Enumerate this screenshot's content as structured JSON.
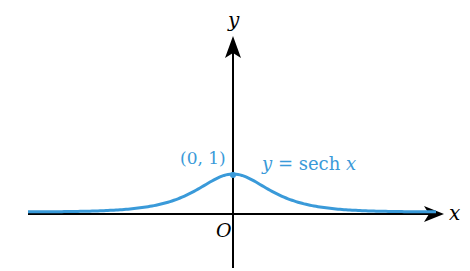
{
  "chart_data": {
    "type": "line",
    "title": "",
    "function": "y = sech x",
    "series": [
      {
        "name": "y = sech x",
        "color": "#3a9ad9",
        "x": [
          -7,
          -6,
          -5,
          -4,
          -3,
          -2.5,
          -2,
          -1.5,
          -1,
          -0.5,
          0,
          0.5,
          1,
          1.5,
          2,
          2.5,
          3,
          4,
          5,
          6,
          7
        ],
        "y": [
          0.002,
          0.005,
          0.013,
          0.037,
          0.099,
          0.163,
          0.266,
          0.425,
          0.648,
          0.887,
          1,
          0.887,
          0.648,
          0.425,
          0.266,
          0.163,
          0.099,
          0.037,
          0.013,
          0.005,
          0.002
        ]
      }
    ],
    "xlabel": "x",
    "ylabel": "y",
    "origin_label": "O",
    "annotations": [
      {
        "text": "(0, 1)",
        "x": 0,
        "y": 1
      },
      {
        "text": "y = sech x",
        "position": "right of peak"
      }
    ],
    "grid": false,
    "legend": "none",
    "axis_color": "#000000"
  },
  "labels": {
    "y_axis": "y",
    "x_axis": "x",
    "origin": "O",
    "point": "(0, 1)",
    "curve_y": "y",
    "curve_eq": " = sech ",
    "curve_x": "x"
  }
}
